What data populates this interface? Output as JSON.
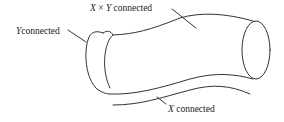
{
  "diagram": {
    "labels": {
      "xy_connected": {
        "var1": "X",
        "op": "×",
        "var2": "Y",
        "text": "connected"
      },
      "y_connected": {
        "var": "Y",
        "text": "connected"
      },
      "x_connected": {
        "var": "X",
        "text": "connected"
      }
    },
    "colors": {
      "stroke": "#333333",
      "background": "#ffffff"
    }
  }
}
